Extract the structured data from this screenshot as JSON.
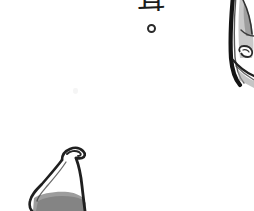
{
  "page": {
    "width": 254,
    "height": 211,
    "background_color": "#ffffff",
    "ink_color": "#1c1c1c",
    "midtone_color": "#7a7a7a",
    "light_tone_color": "#c9c9c9"
  },
  "dialogue": {
    "character": "茸",
    "period": "。",
    "orientation": "vertical",
    "color": "#1c1c1c",
    "cropped_at_top": true
  },
  "artifacts": {
    "faint_mark_label": "faint-speck"
  },
  "objects": [
    {
      "name": "bottle-shape-lower-left",
      "description": "hand-inked bottle / gripped-object outline, cropped by the bottom edge",
      "outline_color": "#1c1c1c",
      "shadow_color": "#8a8a8a"
    },
    {
      "name": "panel-edge-illustration-right",
      "description": "dark panel border with partial figure drawing, cropped by the right edge",
      "outline_color": "#1c1c1c",
      "shadow_color": "#9a9a9a"
    }
  ]
}
